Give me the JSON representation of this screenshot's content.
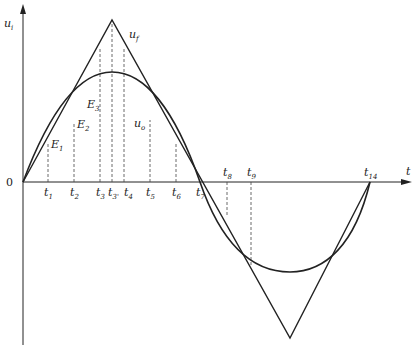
{
  "diagram": {
    "axes": {
      "y_label": "u",
      "y_label_sub": "i",
      "x_label": "t",
      "origin_label": "0"
    },
    "curves": {
      "triangle_label": "u",
      "triangle_label_sub": "f",
      "sine_label": "u",
      "sine_label_sub": "o"
    },
    "points": [
      {
        "name": "E",
        "sub": "1"
      },
      {
        "name": "E",
        "sub": "2"
      },
      {
        "name": "E",
        "sub": "3"
      }
    ],
    "ticks": [
      {
        "name": "t",
        "sub": "1"
      },
      {
        "name": "t",
        "sub": "2"
      },
      {
        "name": "t",
        "sub": "3"
      },
      {
        "name": "t",
        "sub": "3'"
      },
      {
        "name": "t",
        "sub": "4"
      },
      {
        "name": "t",
        "sub": "5"
      },
      {
        "name": "t",
        "sub": "6"
      },
      {
        "name": "t",
        "sub": "7"
      },
      {
        "name": "t",
        "sub": "8"
      },
      {
        "name": "t",
        "sub": "9"
      },
      {
        "name": "t",
        "sub": "14"
      }
    ]
  }
}
